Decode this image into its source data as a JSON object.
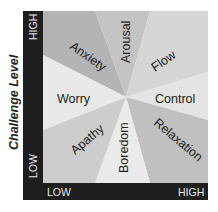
{
  "diagram": {
    "y_axis": {
      "title": "Challenge Level",
      "high": "HIGH",
      "low": "LOW"
    },
    "x_axis": {
      "high": "HIGH",
      "low": "LOW"
    },
    "regions": [
      {
        "name": "Anxiety",
        "color": "#b4b4b4"
      },
      {
        "name": "Arousal",
        "color": "#c4c4c4"
      },
      {
        "name": "Flow",
        "color": "#d6d6d6"
      },
      {
        "name": "Control",
        "color": "#e4e4e4"
      },
      {
        "name": "Relaxation",
        "color": "#c0c0c0"
      },
      {
        "name": "Boredom",
        "color": "#ebebeb"
      },
      {
        "name": "Apathy",
        "color": "#cdcdcd"
      },
      {
        "name": "Worry",
        "color": "#e9e9e9"
      }
    ],
    "colors": {
      "axis_bar": "#1e1e1e",
      "text": "#222222",
      "axis_text": "#e8e8e8"
    }
  }
}
